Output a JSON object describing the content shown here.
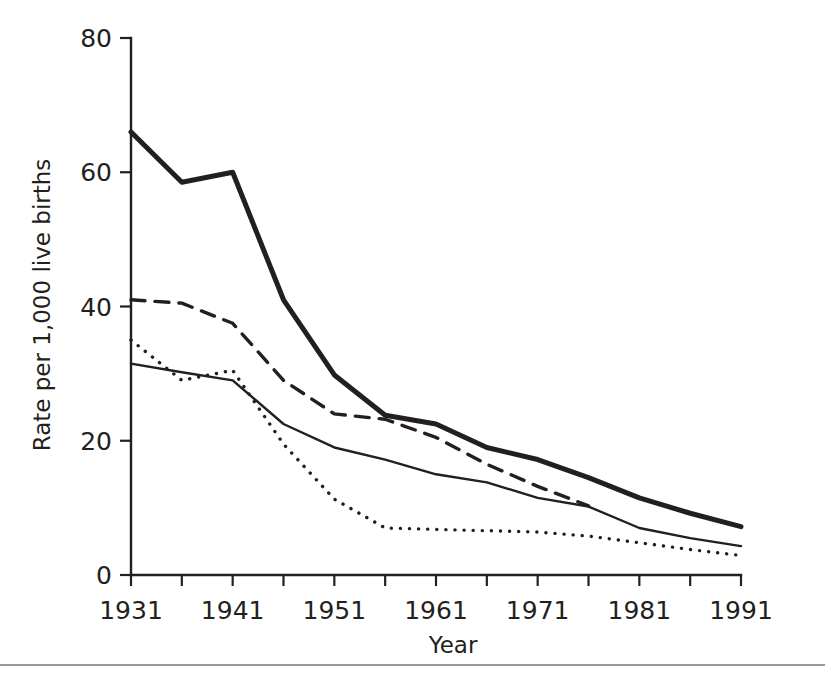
{
  "figure": {
    "background_color": "#ffffff",
    "ink_color": "#231f20",
    "rule_color": "#9a9a9a"
  },
  "axes": {
    "x_title": "Year",
    "y_title": "Rate per 1,000 live births",
    "x_tick_labels": [
      "1931",
      "1941",
      "1951",
      "1961",
      "1971",
      "1981",
      "1991"
    ],
    "y_tick_labels": [
      "0",
      "20",
      "40",
      "60",
      "80"
    ]
  },
  "chart_data": {
    "type": "line",
    "title": "",
    "subtitle": "",
    "xlabel": "Year",
    "ylabel": "Rate per 1,000 live births",
    "xlim": [
      1931,
      1991
    ],
    "ylim": [
      0,
      80
    ],
    "xticks": [
      1931,
      1941,
      1951,
      1961,
      1971,
      1981,
      1991
    ],
    "yticks": [
      0,
      20,
      40,
      60,
      80
    ],
    "grid": false,
    "legend": "none",
    "annotations": [],
    "series": [
      {
        "name": "thick-solid-series",
        "style": "solid",
        "stroke_width": 5,
        "color": "#231f20",
        "x": [
          1931,
          1936,
          1941,
          1946,
          1951,
          1956,
          1961,
          1966,
          1971,
          1976,
          1981,
          1986,
          1991
        ],
        "values": [
          66,
          58.5,
          60,
          41,
          29.8,
          23.8,
          22.5,
          19,
          17.2,
          14.5,
          11.5,
          9.2,
          7.2
        ]
      },
      {
        "name": "dashed-series",
        "style": "dashed",
        "stroke_width": 3.4,
        "color": "#231f20",
        "x": [
          1931,
          1936,
          1941,
          1946,
          1951,
          1956,
          1961,
          1966,
          1971,
          1976
        ],
        "values": [
          41,
          40.5,
          37.5,
          29,
          24,
          23.2,
          20.5,
          16.5,
          13.2,
          10.3
        ]
      },
      {
        "name": "thin-solid-series",
        "style": "solid",
        "stroke_width": 2.4,
        "color": "#231f20",
        "x": [
          1931,
          1936,
          1941,
          1946,
          1951,
          1956,
          1961,
          1966,
          1971,
          1976,
          1981,
          1986,
          1991
        ],
        "values": [
          31.5,
          30.2,
          29,
          22.5,
          19,
          17.2,
          15,
          13.8,
          11.5,
          10.2,
          7,
          5.5,
          4.3
        ]
      },
      {
        "name": "dotted-series",
        "style": "dotted",
        "stroke_width": 3.4,
        "color": "#231f20",
        "x": [
          1931,
          1936,
          1941,
          1946,
          1951,
          1956,
          1961,
          1966,
          1971,
          1976,
          1981,
          1986,
          1991
        ],
        "values": [
          35,
          29,
          30.5,
          19.5,
          11.3,
          7,
          6.8,
          6.6,
          6.4,
          5.8,
          4.8,
          3.8,
          2.9
        ]
      }
    ]
  }
}
